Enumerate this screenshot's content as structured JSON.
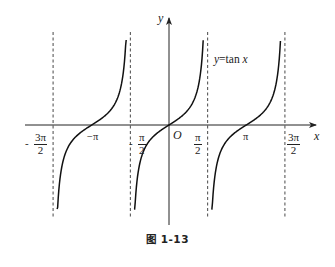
{
  "chart_data": {
    "type": "line",
    "title": "y=tan x",
    "function": "tan",
    "xlabel": "x",
    "ylabel": "y",
    "origin_label": "O",
    "caption": "图 1-13",
    "x_ticks": [
      {
        "value": -4.712,
        "label_num": "3π",
        "label_den": "2",
        "sign": "-"
      },
      {
        "value": -3.1416,
        "label": "−π"
      },
      {
        "value": -1.5708,
        "label_num": "π",
        "label_den": "2",
        "sign": "-"
      },
      {
        "value": 1.5708,
        "label_num": "π",
        "label_den": "2",
        "sign": ""
      },
      {
        "value": 3.1416,
        "label": "π"
      },
      {
        "value": 4.712,
        "label_num": "3π",
        "label_den": "2",
        "sign": ""
      }
    ],
    "asymptotes": [
      -4.712,
      -1.5708,
      1.5708,
      4.712
    ],
    "branches": [
      {
        "center": -3.1416,
        "x_range": [
          -4.55,
          -1.74
        ]
      },
      {
        "center": 0,
        "x_range": [
          -1.42,
          1.39
        ]
      },
      {
        "center": 3.1416,
        "x_range": [
          1.72,
          4.53
        ]
      }
    ],
    "zeros": [
      -3.1416,
      0,
      3.1416
    ],
    "grid": false,
    "legend": null,
    "colors": {
      "curve": "#111111",
      "axis": "#222222",
      "asymptote": "#333333"
    }
  },
  "geometry": {
    "origin_px": [
      169,
      125
    ],
    "px_per_rad": 24.6,
    "px_per_unit_y": 15.5,
    "x_axis_px": [
      25,
      316
    ],
    "y_axis_px": [
      18,
      225
    ],
    "asym_y_px": [
      32,
      217
    ],
    "y_clip_px": [
      40,
      209
    ]
  }
}
